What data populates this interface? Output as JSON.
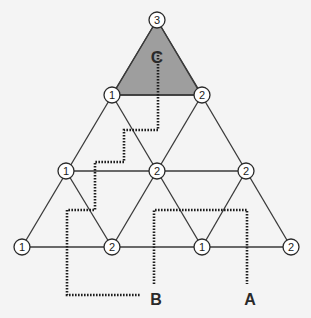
{
  "diagram": {
    "title": "",
    "shaded_region": {
      "label": "C",
      "color": "#9e9e9e"
    },
    "nodes": [
      {
        "id": "top",
        "value": "3",
        "x": 157,
        "y": 20
      },
      {
        "id": "r2-left",
        "value": "1",
        "x": 112,
        "y": 95
      },
      {
        "id": "r2-right",
        "value": "2",
        "x": 202,
        "y": 95
      },
      {
        "id": "r3-left",
        "value": "1",
        "x": 66,
        "y": 171
      },
      {
        "id": "r3-mid",
        "value": "2",
        "x": 157,
        "y": 171
      },
      {
        "id": "r3-right",
        "value": "2",
        "x": 246,
        "y": 171
      },
      {
        "id": "r4-1",
        "value": "1",
        "x": 22,
        "y": 247
      },
      {
        "id": "r4-2",
        "value": "2",
        "x": 112,
        "y": 247
      },
      {
        "id": "r4-3",
        "value": "1",
        "x": 202,
        "y": 247
      },
      {
        "id": "r4-4",
        "value": "2",
        "x": 291,
        "y": 247
      }
    ],
    "labels": {
      "c": "C",
      "b": "B",
      "a": "A"
    },
    "paths": [
      {
        "name": "path-c-to-b",
        "from": "C",
        "to": "B",
        "style": "dotted"
      },
      {
        "name": "path-b-to-a",
        "from": "B",
        "to": "A",
        "style": "dotted"
      }
    ]
  }
}
